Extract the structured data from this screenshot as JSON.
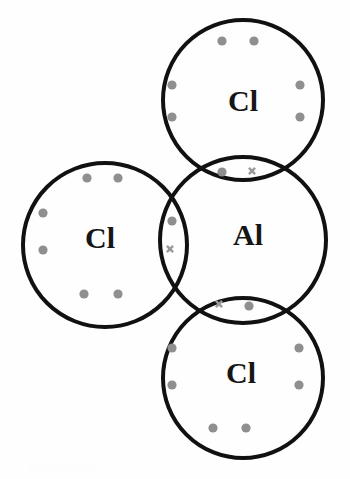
{
  "figure": {
    "title": "Dot-and-cross diagram of aluminium chloride (AlCl3)",
    "canvas": {
      "width": 350,
      "height": 479
    },
    "background_color": "#fefefe",
    "stroke_color": "#111111",
    "stroke_width": 4,
    "dot_color": "#8f8f8f",
    "cross_color": "#9a9a9a",
    "label_color": "#161616",
    "label_font_size": 30,
    "dot_radius": 4.6,
    "cross_size": 6.2,
    "cross_stroke_width": 2.4
  },
  "chart_data": {
    "type": "diagram",
    "subtype": "dot-and-cross Lewis structure",
    "molecule": "AlCl3",
    "title": "Dot-and-cross diagram of aluminium chloride (AlCl3)",
    "legend": [
      {
        "symbol": "dot",
        "meaning": "chlorine electron",
        "color": "#8f8f8f"
      },
      {
        "symbol": "cross",
        "meaning": "aluminium electron",
        "color": "#9a9a9a"
      }
    ],
    "atoms": [
      {
        "id": "cl-top",
        "label": "Cl",
        "cx": 243,
        "cy": 100,
        "r": 80,
        "label_x": 243,
        "label_y": 104
      },
      {
        "id": "cl-left",
        "label": "Cl",
        "cx": 105,
        "cy": 245,
        "r": 82,
        "label_x": 100,
        "label_y": 241
      },
      {
        "id": "al-center",
        "label": "Al",
        "cx": 243,
        "cy": 240,
        "r": 83,
        "label_x": 248,
        "label_y": 238
      },
      {
        "id": "cl-bottom",
        "label": "Cl",
        "cx": 243,
        "cy": 378,
        "r": 80,
        "label_x": 241,
        "label_y": 376
      }
    ],
    "bonds": [
      {
        "id": "bond-al-cl-top",
        "between": [
          "al-center",
          "cl-top"
        ],
        "shared_pair": [
          {
            "type": "dot",
            "x": 222,
            "y": 172
          },
          {
            "type": "cross",
            "x": 252,
            "y": 171
          }
        ]
      },
      {
        "id": "bond-al-cl-left",
        "between": [
          "al-center",
          "cl-left"
        ],
        "shared_pair": [
          {
            "type": "dot",
            "x": 172,
            "y": 221
          },
          {
            "type": "cross",
            "x": 170,
            "y": 249
          }
        ]
      },
      {
        "id": "bond-al-cl-bottom",
        "between": [
          "al-center",
          "cl-bottom"
        ],
        "shared_pair": [
          {
            "type": "cross",
            "x": 219,
            "y": 304
          },
          {
            "type": "dot",
            "x": 249,
            "y": 306
          }
        ]
      }
    ],
    "lone_pair_dots": [
      {
        "atom": "cl-top",
        "x": 222,
        "y": 41
      },
      {
        "atom": "cl-top",
        "x": 254,
        "y": 41
      },
      {
        "atom": "cl-top",
        "x": 172,
        "y": 85
      },
      {
        "atom": "cl-top",
        "x": 172,
        "y": 117
      },
      {
        "atom": "cl-top",
        "x": 300,
        "y": 85
      },
      {
        "atom": "cl-top",
        "x": 300,
        "y": 117
      },
      {
        "atom": "cl-left",
        "x": 87,
        "y": 178
      },
      {
        "atom": "cl-left",
        "x": 118,
        "y": 178
      },
      {
        "atom": "cl-left",
        "x": 43,
        "y": 213
      },
      {
        "atom": "cl-left",
        "x": 43,
        "y": 250
      },
      {
        "atom": "cl-left",
        "x": 84,
        "y": 294
      },
      {
        "atom": "cl-left",
        "x": 118,
        "y": 294
      },
      {
        "atom": "cl-bottom",
        "x": 172,
        "y": 348
      },
      {
        "atom": "cl-bottom",
        "x": 172,
        "y": 385
      },
      {
        "atom": "cl-bottom",
        "x": 299,
        "y": 348
      },
      {
        "atom": "cl-bottom",
        "x": 299,
        "y": 385
      },
      {
        "atom": "cl-bottom",
        "x": 213,
        "y": 428
      },
      {
        "atom": "cl-bottom",
        "x": 246,
        "y": 428
      }
    ],
    "counts": {
      "atoms_total": 4,
      "chlorine_atoms": 3,
      "aluminium_atoms": 1,
      "bonding_pairs": 3,
      "lone_pair_dots": 18,
      "bonding_dots": 3,
      "bonding_crosses": 3
    }
  }
}
